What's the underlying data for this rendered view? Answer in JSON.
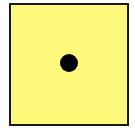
{
  "figure": {
    "shape": "square",
    "fill_color": "#fdf97a",
    "border_color": "#1a1a1a",
    "dot": {
      "shape": "circle",
      "color": "#000000",
      "count": 1,
      "position": "center"
    }
  }
}
